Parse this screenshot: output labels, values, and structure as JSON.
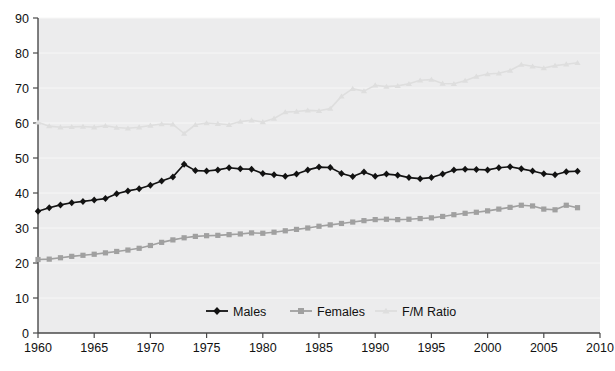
{
  "chart_data": {
    "type": "line",
    "title": "",
    "xlabel": "",
    "ylabel": "",
    "xlim": [
      1960,
      2010
    ],
    "ylim": [
      0,
      90
    ],
    "grid": false,
    "legend_position": "bottom-center",
    "xticks": [
      1960,
      1965,
      1970,
      1975,
      1980,
      1985,
      1990,
      1995,
      2000,
      2005,
      2010
    ],
    "yticks": [
      0,
      10,
      20,
      30,
      40,
      50,
      60,
      70,
      80,
      90
    ],
    "x": [
      1960,
      1961,
      1962,
      1963,
      1964,
      1965,
      1966,
      1967,
      1968,
      1969,
      1970,
      1971,
      1972,
      1973,
      1974,
      1975,
      1976,
      1977,
      1978,
      1979,
      1980,
      1981,
      1982,
      1983,
      1984,
      1985,
      1986,
      1987,
      1988,
      1989,
      1990,
      1991,
      1992,
      1993,
      1994,
      1995,
      1996,
      1997,
      1998,
      1999,
      2000,
      2001,
      2002,
      2003,
      2004,
      2005,
      2006,
      2007,
      2008
    ],
    "series": [
      {
        "name": "Males",
        "color": "#121212",
        "marker": "diamond",
        "values": [
          34.8,
          35.8,
          36.6,
          37.2,
          37.6,
          38.0,
          38.4,
          39.8,
          40.6,
          41.2,
          42.2,
          43.4,
          44.6,
          48.2,
          46.4,
          46.3,
          46.6,
          47.2,
          46.9,
          46.8,
          45.6,
          45.2,
          44.8,
          45.4,
          46.6,
          47.4,
          47.3,
          45.6,
          44.7,
          46.0,
          44.8,
          45.4,
          45.1,
          44.4,
          44.1,
          44.4,
          45.4,
          46.6,
          46.8,
          46.7,
          46.6,
          47.2,
          47.5,
          46.9,
          46.3,
          45.5,
          45.2,
          46.1,
          46.2
        ]
      },
      {
        "name": "Females",
        "color": "#a0a0a0",
        "marker": "square",
        "values": [
          21.0,
          21.1,
          21.5,
          21.9,
          22.2,
          22.5,
          22.9,
          23.3,
          23.7,
          24.2,
          25.0,
          25.9,
          26.6,
          27.2,
          27.6,
          27.8,
          27.9,
          28.1,
          28.3,
          28.6,
          28.5,
          28.8,
          29.2,
          29.6,
          30.0,
          30.5,
          30.9,
          31.3,
          31.7,
          32.1,
          32.4,
          32.5,
          32.4,
          32.5,
          32.7,
          32.9,
          33.3,
          33.8,
          34.2,
          34.5,
          34.9,
          35.4,
          35.9,
          36.5,
          36.3,
          35.4,
          35.2,
          36.5,
          35.8
        ]
      },
      {
        "name": "F/M Ratio",
        "color": "#dedede",
        "marker": "triangle",
        "values": [
          60.2,
          59.1,
          58.8,
          58.9,
          59.0,
          58.8,
          59.2,
          58.7,
          58.5,
          58.8,
          59.3,
          59.7,
          59.6,
          57.0,
          59.5,
          60.0,
          59.8,
          59.5,
          60.4,
          60.8,
          60.3,
          61.3,
          63.1,
          63.3,
          63.6,
          63.5,
          64.1,
          67.6,
          69.8,
          69.1,
          70.8,
          70.4,
          70.6,
          71.2,
          72.2,
          72.4,
          71.3,
          71.2,
          72.1,
          73.3,
          74.0,
          74.2,
          75.0,
          76.7,
          76.2,
          75.7,
          76.4,
          76.8,
          77.2
        ]
      }
    ]
  },
  "legend": {
    "items": [
      {
        "label": "Males"
      },
      {
        "label": "Females"
      },
      {
        "label": "F/M Ratio"
      }
    ]
  }
}
